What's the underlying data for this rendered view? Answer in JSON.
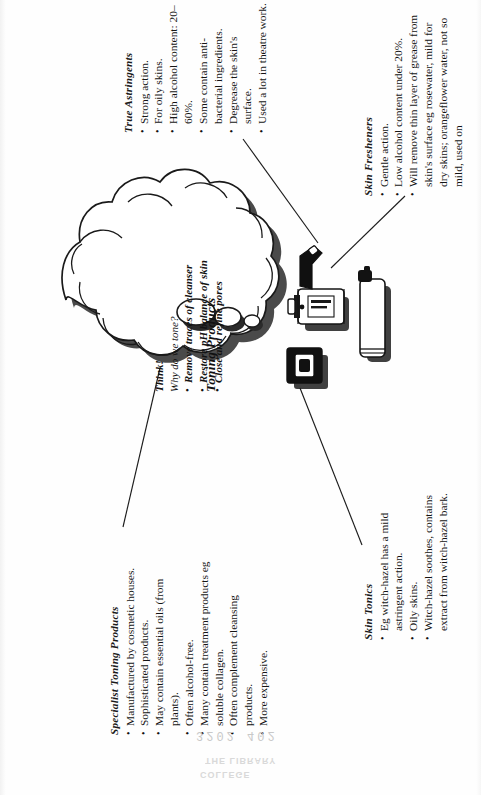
{
  "page": {
    "title": "Toning Products",
    "center_label": "Toning Products"
  },
  "cloud": {
    "title": "Think!",
    "question": "Why do we tone?",
    "points": [
      "Remove traces of cleanser",
      "Restore pH balance of skin",
      "Close and refine pores"
    ]
  },
  "branches": [
    {
      "id": "true-astringents",
      "heading": "True Astringents",
      "bullets": [
        "Strong action.",
        "For oily skins.",
        "High alcohol content: 20–60%.",
        "Some contain anti-bacterial ingredients.",
        "Degrease the skin's surface.",
        "Used a lot in theatre work."
      ]
    },
    {
      "id": "skin-fresheners",
      "heading": "Skin Fresheners",
      "bullets": [
        "Gentle action.",
        "Low alcohol content under 20%.",
        "Will remove thin layer of grease from skin's surface eg rosewater, mild for dry skins; orangeflower water, not so mild, used on"
      ]
    },
    {
      "id": "skin-tonics",
      "heading": "Skin Tonics",
      "bullets": [
        "Eg witch-hazel has a mild astringent action.",
        "Oily skins.",
        "Witch-hazel soothes, contains extract from witch-hazel bark."
      ]
    },
    {
      "id": "specialist-toning-products",
      "heading": "Specialist Toning Products",
      "bullets": [
        "Manufactured by cosmetic houses.",
        "Sophisticated products.",
        "May contain essential oils (from plants).",
        "Often alcohol-free.",
        "Many contain treatment products eg soluble collagen.",
        "Often complement cleansing products.",
        "More expensive."
      ]
    }
  ],
  "artifacts": {
    "library_stamp_line1": "THE LIBRARY",
    "library_stamp_line2": "COLLEGE",
    "barcode_digits": "3202 402"
  },
  "colors": {
    "ink": "#141414",
    "paper": "#fefefe",
    "shadow": "#1d1d1d"
  }
}
